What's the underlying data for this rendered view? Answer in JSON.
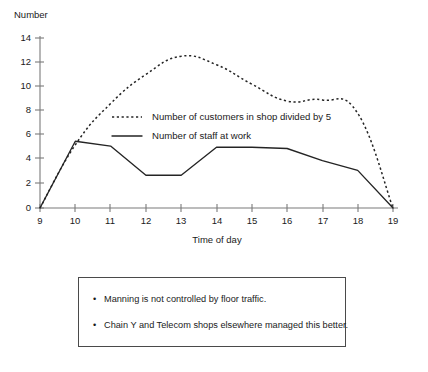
{
  "chart_data": {
    "type": "line",
    "title": "",
    "xlabel": "Time of day",
    "ylabel": "Number",
    "xlim": [
      9,
      19
    ],
    "ylim": [
      0,
      14
    ],
    "grid": false,
    "legend_position": "inside-upper-left",
    "x_ticks": [
      "9",
      "10",
      "11",
      "12",
      "13",
      "14",
      "15",
      "16",
      "17",
      "18",
      "19"
    ],
    "y_ticks": [
      "0",
      "2",
      "4",
      "6",
      "8",
      "10",
      "12",
      "14"
    ],
    "x": [
      9,
      10,
      11,
      12,
      13,
      14,
      15,
      16,
      17,
      18,
      19
    ],
    "series": [
      {
        "name": "Number of customers in shop divided by 5",
        "style": "dotted",
        "values": [
          0,
          5.2,
          8.6,
          11.0,
          12.5,
          11.8,
          10.2,
          8.8,
          8.9,
          7.8,
          0
        ]
      },
      {
        "name": "Number of staff at work",
        "style": "solid",
        "values": [
          0,
          5.5,
          5.1,
          2.7,
          2.7,
          5.0,
          5.0,
          4.9,
          3.9,
          3.1,
          0
        ]
      }
    ]
  },
  "axes": {
    "y_axis_title": "Number",
    "x_axis_title": "Time of day"
  },
  "legend": {
    "entries": [
      {
        "label": "Number of customers in shop divided by 5",
        "style": "dotted"
      },
      {
        "label": "Number of staff at work",
        "style": "solid"
      }
    ]
  },
  "notes": {
    "bullet_char": "•",
    "items": [
      "Manning is not controlled by floor traffic.",
      "Chain Y and Telecom shops elsewhere managed this better."
    ]
  }
}
